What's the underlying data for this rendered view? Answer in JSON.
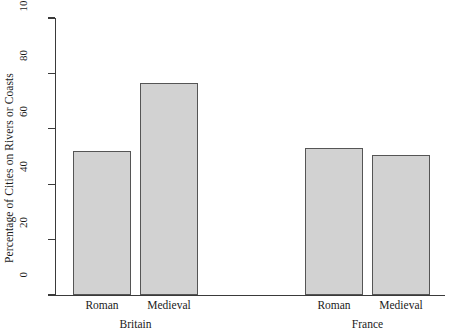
{
  "chart_data": {
    "type": "bar",
    "title": "",
    "xlabel": "",
    "ylabel": "Percentage of Cities on Rivers or Coasts",
    "ylim": [
      0,
      100
    ],
    "yticks": [
      0,
      20,
      40,
      60,
      80,
      100
    ],
    "grid": false,
    "legend": "none",
    "groups": [
      {
        "name": "Britain",
        "categories": [
          "Roman",
          "Medieval"
        ],
        "values": [
          52,
          76.5
        ]
      },
      {
        "name": "France",
        "categories": [
          "Roman",
          "Medieval"
        ],
        "values": [
          53,
          50.5
        ]
      }
    ],
    "categories": [
      "Roman",
      "Medieval",
      "Roman",
      "Medieval"
    ],
    "values": [
      52,
      76.5,
      53,
      50.5
    ],
    "bar_fill_color": "#d2d2d2",
    "bar_border_color": "#555555",
    "axis_color": "#3a3a3a",
    "background_color": "#ffffff"
  }
}
